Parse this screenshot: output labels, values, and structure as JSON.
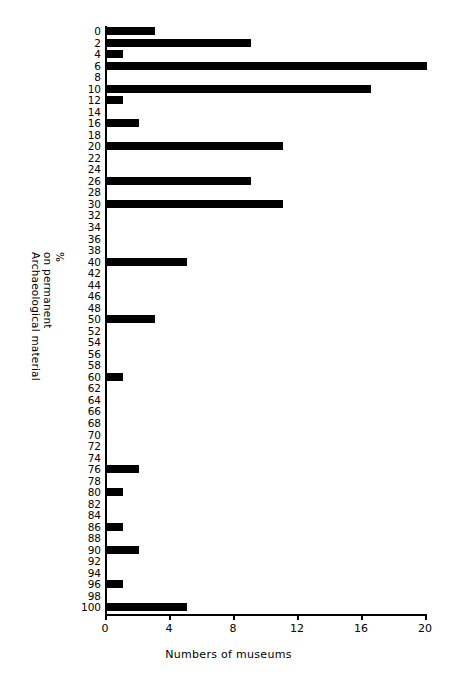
{
  "chart_data": {
    "type": "bar",
    "orientation": "horizontal",
    "title": "",
    "xlabel": "Numbers of museums",
    "ylabel": "Archaeological material on permanent display %",
    "ylabel_lines": [
      "Archaeological material",
      "on permanent",
      "%"
    ],
    "xlim": [
      0,
      20
    ],
    "xticks": [
      0,
      4,
      8,
      12,
      16,
      20
    ],
    "xtick_labels": [
      "0",
      "4",
      "8",
      "12",
      "16",
      "20"
    ],
    "grid": false,
    "legend": false,
    "bar_color": "#000000",
    "categories": [
      0,
      2,
      4,
      6,
      8,
      10,
      12,
      14,
      16,
      18,
      20,
      22,
      24,
      26,
      28,
      30,
      32,
      34,
      36,
      38,
      40,
      42,
      44,
      46,
      48,
      50,
      52,
      54,
      56,
      58,
      60,
      62,
      64,
      66,
      68,
      70,
      72,
      74,
      76,
      78,
      80,
      82,
      84,
      86,
      88,
      90,
      92,
      94,
      96,
      98,
      100
    ],
    "category_labels": [
      "0",
      "2",
      "4",
      "6",
      "8",
      "10",
      "12",
      "14",
      "16",
      "18",
      "20",
      "22",
      "24",
      "26",
      "28",
      "30",
      "32",
      "34",
      "36",
      "38",
      "40",
      "42",
      "44",
      "46",
      "48",
      "50",
      "52",
      "54",
      "56",
      "58",
      "60",
      "62",
      "64",
      "66",
      "68",
      "70",
      "72",
      "74",
      "76",
      "78",
      "80",
      "82",
      "84",
      "86",
      "88",
      "90",
      "92",
      "94",
      "96",
      "98",
      "100"
    ],
    "values": [
      3,
      9,
      1,
      20,
      0,
      16.5,
      1,
      0,
      2,
      0,
      11,
      0,
      0,
      9,
      0,
      11,
      0,
      0,
      0,
      0,
      5,
      0,
      0,
      0,
      0,
      3,
      0,
      0,
      0,
      0,
      1,
      0,
      0,
      0,
      0,
      0,
      0,
      0,
      2,
      0,
      1,
      0,
      0,
      1,
      0,
      2,
      0,
      0,
      1,
      0,
      5
    ]
  }
}
